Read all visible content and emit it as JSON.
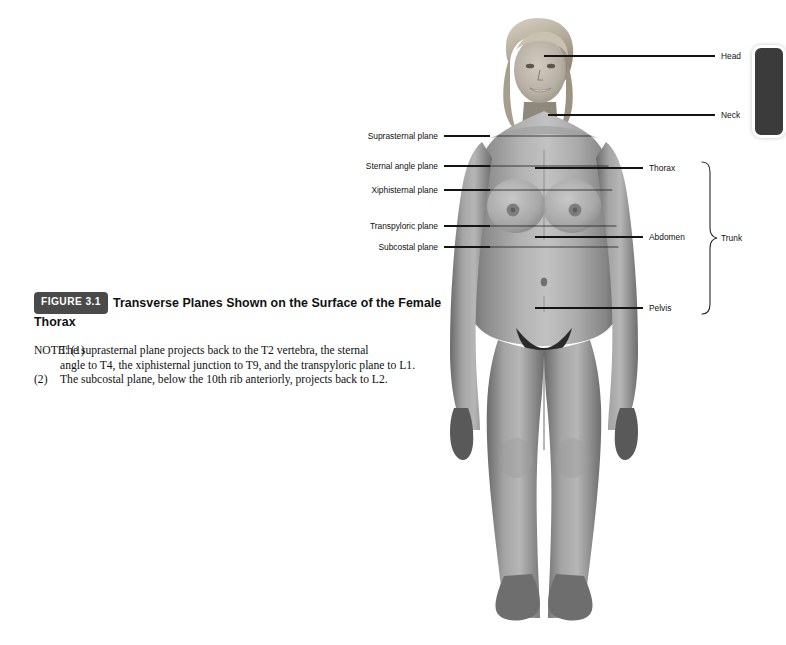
{
  "page": {
    "background_color": "#ffffff"
  },
  "caption": {
    "badge": "FIGURE 3.1",
    "title": "Transverse Planes Shown on the Surface of the Female Thorax",
    "badge_color": "#4a4a4a",
    "badge_text_color": "#ffffff"
  },
  "note": {
    "lead": "NOTE:",
    "item1_marker": "(1)",
    "item1_line1": "The suprasternal plane projects back to the T2 vertebra, the sternal",
    "item1_line2": "angle to T4, the xiphisternal junction to T9, and the transpyloric plane to L1.",
    "item2_marker": "(2)",
    "item2_text": "The subcostal plane, below the 10th rib anteriorly, projects back to L2."
  },
  "figure": {
    "line_color": "#141414",
    "label_color": "#111111",
    "left_labels": [
      {
        "text": "Suprasternal plane",
        "y": 136
      },
      {
        "text": "Sternal angle plane",
        "y": 166
      },
      {
        "text": "Xiphisternal plane",
        "y": 190
      },
      {
        "text": "Transpyloric plane",
        "y": 226
      },
      {
        "text": "Subcostal plane",
        "y": 247
      }
    ],
    "right_labels": [
      {
        "text": "Head",
        "y": 56
      },
      {
        "text": "Neck",
        "y": 115
      },
      {
        "text": "Thorax",
        "y": 168
      },
      {
        "text": "Abdomen",
        "y": 237
      },
      {
        "text": "Pelvis",
        "y": 308
      }
    ],
    "group_label": "Trunk",
    "subject_alt": "Photograph of a standing female subject, anterior view, showing surface anatomy"
  }
}
